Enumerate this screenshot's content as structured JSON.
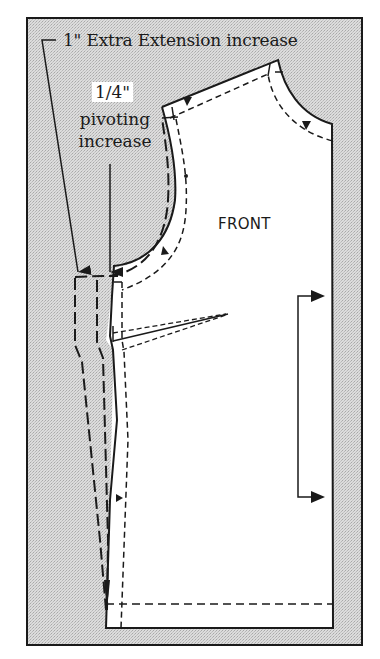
{
  "diagram": {
    "labels": {
      "extra_extension": "1\" Extra Extension increase",
      "quarter": "1/4\"",
      "pivoting": "pivoting",
      "increase": "increase",
      "front": "FRONT"
    },
    "colors": {
      "background_frame": "#d4d4d4",
      "pattern_fill": "#ffffff",
      "line": "#1a1a1a"
    }
  }
}
